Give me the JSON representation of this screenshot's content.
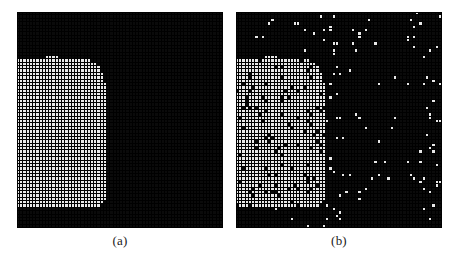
{
  "figure": {
    "background_color": "#ffffff",
    "panels": [
      {
        "id": "a",
        "caption": "(a)",
        "description": "Clean lattice: solid white rounded-rectangle domain on black background",
        "grid_cols": 64,
        "grid_rows": 64,
        "cell_color_on": "#e8e8e8",
        "cell_color_off": "#0a0a0a",
        "grid_line_color": "#000000",
        "noise_density": 0.0
      },
      {
        "id": "b",
        "caption": "(b)",
        "description": "Noisy lattice: same domain corrupted with salt-and-pepper noise",
        "grid_cols": 64,
        "grid_rows": 64,
        "cell_color_on": "#e8e8e8",
        "cell_color_off": "#0a0a0a",
        "grid_line_color": "#000000",
        "noise_density": 0.06
      }
    ]
  },
  "chart_data": {
    "type": "heatmap",
    "title": "",
    "xlabel": "",
    "ylabel": "",
    "grid": true,
    "legend": "none",
    "colormap": {
      "0": "#0a0a0a",
      "1": "#e8e8e8"
    },
    "panel_labels": [
      "(a)",
      "(b)"
    ],
    "nx": 64,
    "ny": 64,
    "xlim": [
      0,
      64
    ],
    "ylim": [
      0,
      64
    ],
    "domain_shape": {
      "kind": "rounded-rectangle",
      "left_col": 0,
      "right_col": 27,
      "top_row": 13,
      "bottom_row": 57,
      "corner_radius_cells": 8,
      "notes": "White cluster occupies the left-lower portion; flat left and bottom edges, rounded upper-right corner"
    },
    "series": [
      {
        "name": "panel-a-clean",
        "noise_fraction": 0.0,
        "white_cell_count": 1100,
        "black_cell_count": 2996
      },
      {
        "name": "panel-b-noisy",
        "noise_fraction": 0.06,
        "white_cell_count": 1260,
        "black_cell_count": 2836,
        "noise_notes": "Isolated white cells scattered across black region, concentrated near top and right borders and along a horizontal band near row 49; isolated black cells inside the white cluster"
      }
    ]
  }
}
